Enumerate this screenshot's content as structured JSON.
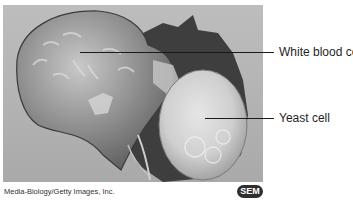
{
  "figure": {
    "image_description": "Scanning electron micrograph of a white blood cell engulfing a yeast cell",
    "labels": [
      {
        "text": "White blood cell",
        "target": "white-blood-cell"
      },
      {
        "text": "Yeast cell",
        "target": "yeast-cell"
      }
    ],
    "credit": "Media-Biology/Getty Images, Inc.",
    "badge": "SEM"
  },
  "colors": {
    "background": "#ffffff",
    "micrograph_bg": "#b5b5b5",
    "leader_line": "#1a1a1a",
    "label_text": "#1f1f1f",
    "badge_bg": "#2f2f2f",
    "badge_text": "#ffffff"
  }
}
